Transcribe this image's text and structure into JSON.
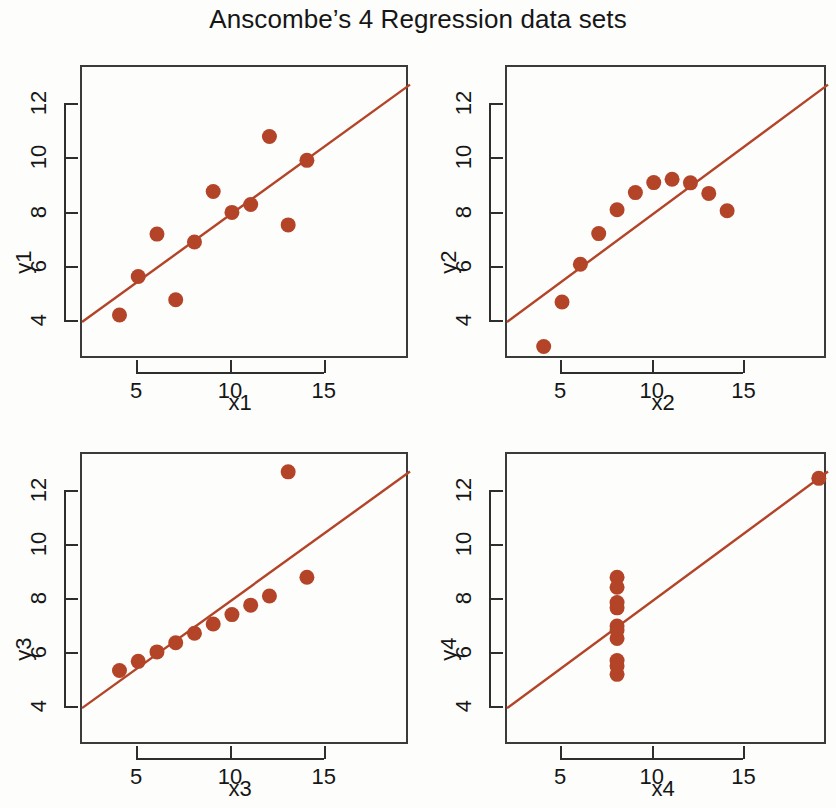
{
  "title": "Anscombe’s 4 Regression data sets",
  "style": {
    "point_color": "#b34428",
    "line_color": "#b34428",
    "axis_color": "#3b3b3b",
    "background": "#fdfdfc",
    "text_color": "#161616"
  },
  "chart_data": [
    {
      "type": "scatter",
      "title": "",
      "xlabel": "x1",
      "ylabel": "y1",
      "xlim": [
        2.0,
        19.5
      ],
      "ylim": [
        2.6,
        13.4
      ],
      "xticks": [
        5,
        10,
        15
      ],
      "yticks": [
        4,
        6,
        8,
        10,
        12
      ],
      "grid": false,
      "legend": "none",
      "x": [
        10,
        8,
        13,
        9,
        11,
        14,
        6,
        4,
        12,
        7,
        5
      ],
      "y": [
        8.04,
        6.95,
        7.58,
        8.81,
        8.33,
        9.96,
        7.24,
        4.26,
        10.84,
        4.82,
        5.68
      ],
      "fit": {
        "intercept": 3.0,
        "slope": 0.5,
        "label": "regression line"
      }
    },
    {
      "type": "scatter",
      "title": "",
      "xlabel": "x2",
      "ylabel": "y2",
      "xlim": [
        2.0,
        19.5
      ],
      "ylim": [
        2.6,
        13.4
      ],
      "xticks": [
        5,
        10,
        15
      ],
      "yticks": [
        4,
        6,
        8,
        10,
        12
      ],
      "grid": false,
      "legend": "none",
      "x": [
        10,
        8,
        13,
        9,
        11,
        14,
        6,
        4,
        12,
        7,
        5
      ],
      "y": [
        9.14,
        8.14,
        8.74,
        8.77,
        9.26,
        8.1,
        6.13,
        3.1,
        9.13,
        7.26,
        4.74
      ],
      "fit": {
        "intercept": 3.0,
        "slope": 0.5,
        "label": "regression line"
      }
    },
    {
      "type": "scatter",
      "title": "",
      "xlabel": "x3",
      "ylabel": "y3",
      "xlim": [
        2.0,
        19.5
      ],
      "ylim": [
        2.6,
        13.4
      ],
      "xticks": [
        5,
        10,
        15
      ],
      "yticks": [
        4,
        6,
        8,
        10,
        12
      ],
      "grid": false,
      "legend": "none",
      "x": [
        10,
        8,
        13,
        9,
        11,
        14,
        6,
        4,
        12,
        7,
        5
      ],
      "y": [
        7.46,
        6.77,
        12.74,
        7.11,
        7.81,
        8.84,
        6.08,
        5.39,
        8.15,
        6.42,
        5.73
      ],
      "fit": {
        "intercept": 3.0,
        "slope": 0.5,
        "label": "regression line"
      }
    },
    {
      "type": "scatter",
      "title": "",
      "xlabel": "x4",
      "ylabel": "y4",
      "xlim": [
        2.0,
        19.5
      ],
      "ylim": [
        2.6,
        13.4
      ],
      "xticks": [
        5,
        10,
        15
      ],
      "yticks": [
        4,
        6,
        8,
        10,
        12
      ],
      "grid": false,
      "legend": "none",
      "x": [
        8,
        8,
        8,
        8,
        8,
        8,
        8,
        19,
        8,
        8,
        8
      ],
      "y": [
        6.58,
        5.76,
        7.71,
        8.84,
        8.47,
        7.04,
        5.25,
        12.5,
        5.56,
        7.91,
        6.89
      ],
      "fit": {
        "intercept": 3.0,
        "slope": 0.5,
        "label": "regression line"
      }
    }
  ],
  "panels": [
    {
      "name": "panel-1",
      "xlabel": "x1",
      "ylabel": "y1",
      "xticklabels": [
        "5",
        "10",
        "15"
      ],
      "yticklabels": [
        "4",
        "6",
        "8",
        "10",
        "12"
      ]
    },
    {
      "name": "panel-2",
      "xlabel": "x2",
      "ylabel": "y2",
      "xticklabels": [
        "5",
        "10",
        "15"
      ],
      "yticklabels": [
        "4",
        "6",
        "8",
        "10",
        "12"
      ]
    },
    {
      "name": "panel-3",
      "xlabel": "x3",
      "ylabel": "y3",
      "xticklabels": [
        "5",
        "10",
        "15"
      ],
      "yticklabels": [
        "4",
        "6",
        "8",
        "10",
        "12"
      ]
    },
    {
      "name": "panel-4",
      "xlabel": "x4",
      "ylabel": "y4",
      "xticklabels": [
        "5",
        "10",
        "15"
      ],
      "yticklabels": [
        "4",
        "6",
        "8",
        "10",
        "12"
      ]
    }
  ]
}
